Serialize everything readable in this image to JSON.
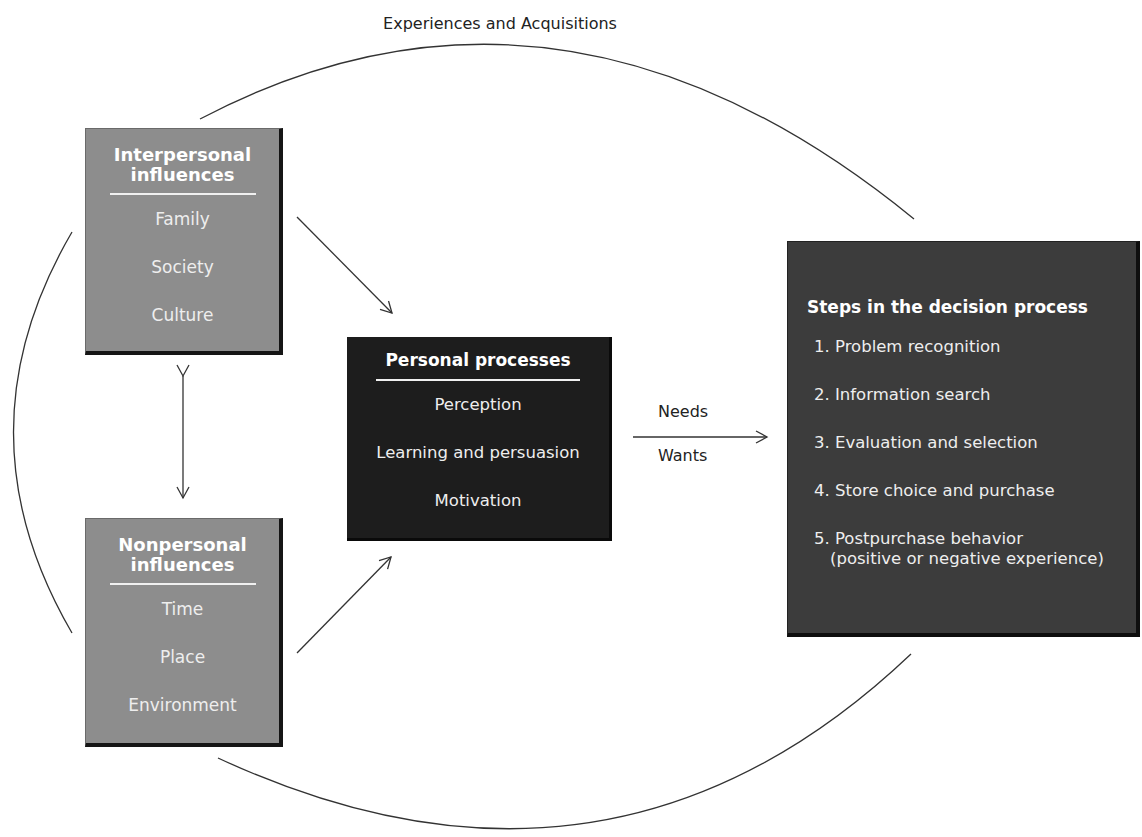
{
  "diagram": {
    "cycle_label": "Experiences and Acquisitions",
    "interpersonal": {
      "title_line1": "Interpersonal",
      "title_line2": "influences",
      "items": [
        "Family",
        "Society",
        "Culture"
      ]
    },
    "nonpersonal": {
      "title_line1": "Nonpersonal",
      "title_line2": "influences",
      "items": [
        "Time",
        "Place",
        "Environment"
      ]
    },
    "personal": {
      "title": "Personal processes",
      "items": [
        "Perception",
        "Learning and persuasion",
        "Motivation"
      ]
    },
    "connector": {
      "above": "Needs",
      "below": "Wants"
    },
    "steps": {
      "title": "Steps in the decision process",
      "items": [
        "1. Problem recognition",
        "2. Information search",
        "3. Evaluation and selection",
        "4. Store choice and purchase",
        "5. Postpurchase behavior"
      ],
      "item5_note": "(positive or negative experience)"
    },
    "colors": {
      "interpersonal_box": "#8d8d8d",
      "nonpersonal_box": "#8d8d8d",
      "personal_box": "#1d1d1d",
      "steps_box": "#3c3c3c",
      "lines": "#333333"
    }
  }
}
